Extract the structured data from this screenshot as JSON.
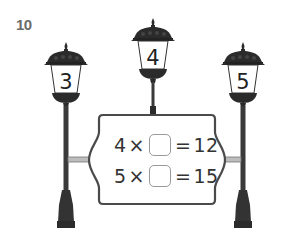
{
  "question": {
    "number": "10"
  },
  "lamps": [
    {
      "id": "left",
      "value": "3"
    },
    {
      "id": "middle",
      "value": "4"
    },
    {
      "id": "right",
      "value": "5"
    }
  ],
  "sign": {
    "equations": [
      {
        "factor": "4",
        "op": "×",
        "blank": "",
        "eq": "=",
        "result": "12"
      },
      {
        "factor": "5",
        "op": "×",
        "blank": "",
        "eq": "=",
        "result": "15"
      }
    ]
  },
  "colors": {
    "lamp": "#2b2b2b",
    "pole": "#3a3a3a",
    "frame": "#4a4a4a",
    "label": "#6b6b6b"
  }
}
